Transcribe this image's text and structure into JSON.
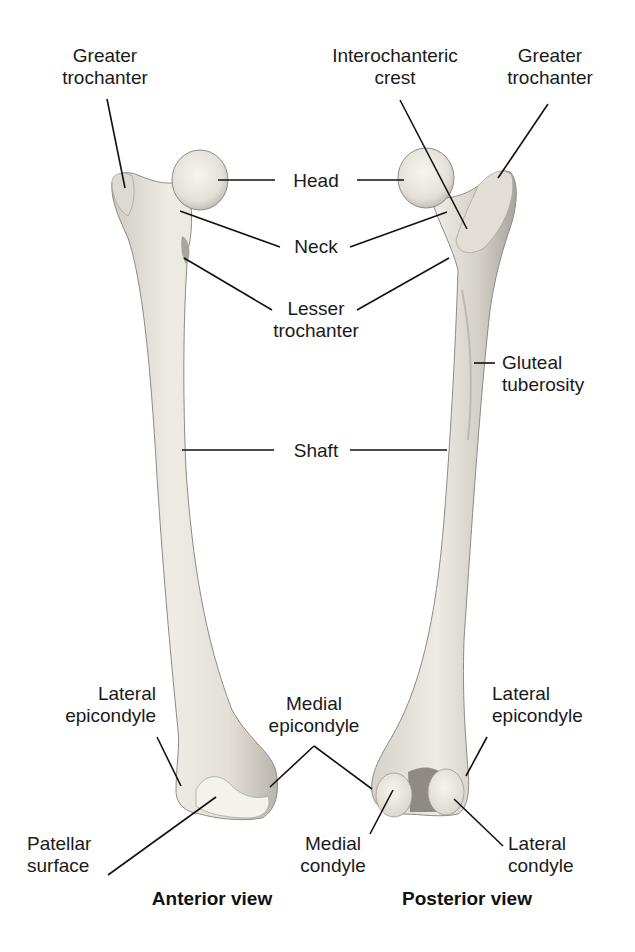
{
  "figure": {
    "width": 635,
    "height": 952,
    "colors": {
      "background": "#ffffff",
      "bone_fill": "#ebe8e1",
      "bone_shade": "#c9c5bc",
      "bone_dark": "#a9a59c",
      "bone_outline": "#8f8b83",
      "articular": "#f4f2ec",
      "leader_line": "#111111",
      "label_text": "#1a1a1a"
    }
  },
  "views": [
    {
      "id": "anterior",
      "caption": "Anterior view",
      "caption_x": 212,
      "caption_y": 908
    },
    {
      "id": "posterior",
      "caption": "Posterior view",
      "caption_x": 467,
      "caption_y": 908
    }
  ],
  "labels": [
    {
      "id": "greater-trochanter-anterior",
      "lines": [
        "Greater",
        "trochanter"
      ],
      "x": 105,
      "y": 45,
      "align": "center"
    },
    {
      "id": "interochanteric-crest",
      "lines": [
        "Interochanteric",
        "crest"
      ],
      "x": 395,
      "y": 45,
      "align": "center"
    },
    {
      "id": "greater-trochanter-posterior",
      "lines": [
        "Greater",
        "trochanter"
      ],
      "x": 550,
      "y": 45,
      "align": "center"
    },
    {
      "id": "head",
      "lines": [
        "Head"
      ],
      "x": 316,
      "y": 170,
      "align": "center"
    },
    {
      "id": "neck",
      "lines": [
        "Neck"
      ],
      "x": 316,
      "y": 236,
      "align": "center"
    },
    {
      "id": "lesser-trochanter",
      "lines": [
        "Lesser",
        "trochanter"
      ],
      "x": 316,
      "y": 298,
      "align": "center"
    },
    {
      "id": "gluteal-tuberosity",
      "lines": [
        "Gluteal",
        "tuberosity"
      ],
      "x": 502,
      "y": 352,
      "align": "left"
    },
    {
      "id": "shaft",
      "lines": [
        "Shaft"
      ],
      "x": 316,
      "y": 440,
      "align": "center"
    },
    {
      "id": "lateral-epicondyle-anterior",
      "lines": [
        "Lateral",
        "epicondyle"
      ],
      "x": 156,
      "y": 683,
      "align": "right"
    },
    {
      "id": "medial-epicondyle",
      "lines": [
        "Medial",
        "epicondyle"
      ],
      "x": 314,
      "y": 693,
      "align": "center"
    },
    {
      "id": "lateral-epicondyle-posterior",
      "lines": [
        "Lateral",
        "epicondyle"
      ],
      "x": 492,
      "y": 683,
      "align": "left"
    },
    {
      "id": "patellar-surface",
      "lines": [
        "Patellar",
        "surface"
      ],
      "x": 27,
      "y": 833,
      "align": "left"
    },
    {
      "id": "medial-condyle",
      "lines": [
        "Medial",
        "condyle"
      ],
      "x": 333,
      "y": 833,
      "align": "center"
    },
    {
      "id": "lateral-condyle",
      "lines": [
        "Lateral",
        "condyle"
      ],
      "x": 508,
      "y": 833,
      "align": "left"
    }
  ],
  "leader_lines": [
    {
      "label": "greater-trochanter-anterior",
      "x1": 107,
      "y1": 99,
      "x2": 125,
      "y2": 188
    },
    {
      "label": "head",
      "x1": 275,
      "y1": 180,
      "x2": 218,
      "y2": 180
    },
    {
      "label": "head",
      "x1": 357,
      "y1": 180,
      "x2": 404,
      "y2": 180
    },
    {
      "label": "neck",
      "x1": 280,
      "y1": 247,
      "x2": 180,
      "y2": 211
    },
    {
      "label": "neck",
      "x1": 350,
      "y1": 247,
      "x2": 447,
      "y2": 212
    },
    {
      "label": "lesser-trochanter",
      "x1": 272,
      "y1": 310,
      "x2": 184,
      "y2": 258
    },
    {
      "label": "lesser-trochanter",
      "x1": 357,
      "y1": 310,
      "x2": 449,
      "y2": 258
    },
    {
      "label": "interochanteric-crest",
      "x1": 400,
      "y1": 100,
      "x2": 467,
      "y2": 229
    },
    {
      "label": "greater-trochanter-posterior",
      "x1": 548,
      "y1": 104,
      "x2": 498,
      "y2": 178
    },
    {
      "label": "gluteal-tuberosity",
      "x1": 495,
      "y1": 363,
      "x2": 474,
      "y2": 363
    },
    {
      "label": "shaft",
      "x1": 274,
      "y1": 450,
      "x2": 182,
      "y2": 450
    },
    {
      "label": "shaft",
      "x1": 350,
      "y1": 450,
      "x2": 447,
      "y2": 450
    },
    {
      "label": "lateral-epicondyle-anterior",
      "x1": 157,
      "y1": 737,
      "x2": 181,
      "y2": 786
    },
    {
      "label": "medial-epicondyle",
      "x1": 314,
      "y1": 746,
      "x2": 270,
      "y2": 787
    },
    {
      "label": "medial-epicondyle",
      "x1": 314,
      "y1": 746,
      "x2": 372,
      "y2": 789
    },
    {
      "label": "lateral-epicondyle-posterior",
      "x1": 487,
      "y1": 737,
      "x2": 466,
      "y2": 776
    },
    {
      "label": "patellar-surface",
      "x1": 108,
      "y1": 875,
      "x2": 216,
      "y2": 797
    },
    {
      "label": "medial-condyle",
      "x1": 370,
      "y1": 834,
      "x2": 393,
      "y2": 790
    },
    {
      "label": "lateral-condyle",
      "x1": 503,
      "y1": 846,
      "x2": 454,
      "y2": 799
    }
  ]
}
